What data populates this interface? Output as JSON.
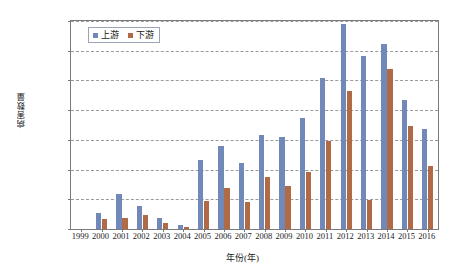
{
  "chart_data": {
    "type": "bar",
    "title": "",
    "xlabel": "年份(年)",
    "ylabel": "病害数量",
    "categories": [
      "1999",
      "2000",
      "2001",
      "2002",
      "2003",
      "2004",
      "2005",
      "2006",
      "2007",
      "2008",
      "2009",
      "2010",
      "2011",
      "2012",
      "2013",
      "2014",
      "2015",
      "2016"
    ],
    "series": [
      {
        "name": "上游",
        "color": "#7089b8",
        "values": [
          0,
          165,
          355,
          230,
          110,
          45,
          700,
          840,
          665,
          950,
          925,
          1120,
          1520,
          2070,
          1745,
          1870,
          1300,
          1010
        ]
      },
      {
        "name": "下游",
        "color": "#b06a45",
        "values": [
          0,
          105,
          110,
          145,
          65,
          20,
          285,
          410,
          275,
          530,
          435,
          580,
          890,
          1390,
          290,
          1615,
          1045,
          640
        ]
      }
    ],
    "ylim": [
      0,
      2100
    ],
    "yticks": [
      0,
      300,
      600,
      900,
      1200,
      1500,
      1800,
      2100
    ],
    "ytick_labels": [
      "0",
      "300",
      "600",
      "900",
      "1 200",
      "1 500",
      "1 800",
      "2 100"
    ],
    "grid": "horizontal-dashed",
    "legend_position": "top-left-inside"
  },
  "legend": {
    "entries": [
      {
        "label": "上游",
        "color": "#7089b8"
      },
      {
        "label": "下游",
        "color": "#b06a45"
      }
    ]
  }
}
